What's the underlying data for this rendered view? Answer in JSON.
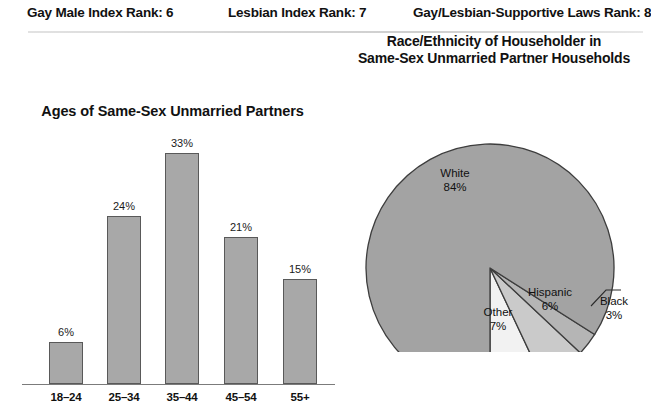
{
  "header": {
    "items": [
      {
        "label": "Gay Male Index Rank: 6"
      },
      {
        "label": "Lesbian Index Rank: 7"
      },
      {
        "label": "Gay/Lesbian-Supportive Laws Rank: 8"
      }
    ]
  },
  "colors": {
    "bar_fill": "#a8a8a8",
    "bar_stroke": "#595959",
    "pie_main": "#a3a3a3",
    "pie_black_slice": "#b5b5b5",
    "pie_hispanic_slice": "#cacaca",
    "pie_other_slice": "#f2f2f2",
    "pie_stroke": "#3d3d3d",
    "axis": "#7b7b7b",
    "rule": "#d8d8d8",
    "text": "#111111",
    "background": "#ffffff"
  },
  "chart_data": [
    {
      "type": "bar",
      "title": "Ages of Same-Sex Unmarried Partners",
      "xlabel": "",
      "ylabel": "",
      "ylim": [
        0,
        35
      ],
      "grid": false,
      "legend": "none",
      "categories": [
        "18–24",
        "25–34",
        "35–44",
        "45–54",
        "55+"
      ],
      "values": [
        6,
        24,
        33,
        21,
        15
      ],
      "value_labels": [
        "6%",
        "24%",
        "33%",
        "21%",
        "15%"
      ]
    },
    {
      "type": "pie",
      "title": "Race/Ethnicity of Householder in Same-Sex Unmarried Partner Households",
      "title_line1": "Race/Ethnicity of Householder in",
      "title_line2": "Same-Sex Unmarried Partner Households",
      "legend": "none",
      "labels": [
        "White",
        "Other",
        "Hispanic",
        "Black"
      ],
      "values": [
        84,
        7,
        6,
        3
      ],
      "value_labels": [
        "84%",
        "7%",
        "6%",
        "3%"
      ],
      "slices": [
        {
          "name": "White",
          "value": 84,
          "value_label": "84%",
          "color": "#a3a3a3"
        },
        {
          "name": "Other",
          "value": 7,
          "value_label": "7%",
          "color": "#f2f2f2"
        },
        {
          "name": "Hispanic",
          "value": 6,
          "value_label": "6%",
          "color": "#cacaca"
        },
        {
          "name": "Black",
          "value": 3,
          "value_label": "3%",
          "color": "#b5b5b5"
        }
      ]
    }
  ]
}
